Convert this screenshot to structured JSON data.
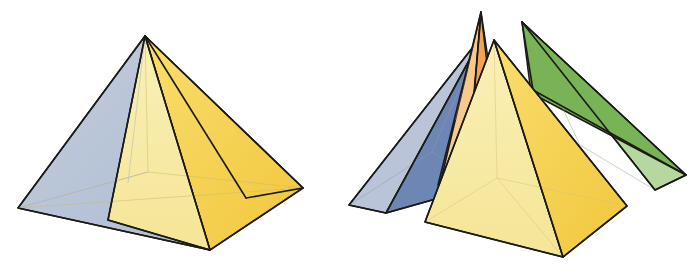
{
  "figure": {
    "caption_left": "Assembled square pyramid",
    "caption_right": "Exploded view showing the four component pieces",
    "background_color": "#ffffff",
    "outline_color": "#1a1a16",
    "hidden_edge_color": "#c9b96a"
  },
  "palette": {
    "blue_light": "#b9c4d8",
    "blue_mid": "#9aaac6",
    "blue_dark": "#6d86b4",
    "blue_darker": "#5b76a8",
    "yellow_pale": "#f8edab",
    "yellow_pale_2": "#f6e79a",
    "yellow_gold": "#f8d75a",
    "yellow_gold_2": "#f2c93f",
    "green_light": "#b7d7a0",
    "green_mid": "#8fc06b",
    "green_dark": "#6fae4f",
    "orange_light": "#f8c98c",
    "orange_mid": "#f4ac5c",
    "orange_dark": "#ef9a42"
  },
  "assembled_pyramid": {
    "name": "assembled-square-pyramid",
    "apex": {
      "x": 145,
      "y": 36
    },
    "base_vertices": {
      "left": {
        "x": 18,
        "y": 208
      },
      "front": {
        "x": 210,
        "y": 250
      },
      "right": {
        "x": 303,
        "y": 188
      },
      "back": {
        "x": 148,
        "y": 172
      }
    },
    "faces": [
      {
        "id": "left-blue-face",
        "label": "left blue face",
        "color": "#b9c4d8",
        "points": "145,36 18,208 210,250"
      },
      {
        "id": "front-pale-face",
        "label": "front pale yellow face",
        "color": "#f8edab",
        "points": "145,36 110,223 210,250"
      },
      {
        "id": "front-gold-face",
        "label": "front gold face",
        "color": "#f8d75a",
        "points": "145,36 210,250 303,188"
      },
      {
        "id": "right-green-face",
        "label": "right green face",
        "color": "#8fc06b",
        "points": "145,36 303,188 253,196"
      }
    ],
    "hidden_edges": [
      {
        "id": "hidden-apex-to-back",
        "from": {
          "x": 145,
          "y": 36
        },
        "to": {
          "x": 148,
          "y": 172
        }
      },
      {
        "id": "hidden-back-left",
        "from": {
          "x": 18,
          "y": 208
        },
        "to": {
          "x": 148,
          "y": 172
        }
      },
      {
        "id": "hidden-back-right",
        "from": {
          "x": 303,
          "y": 188
        },
        "to": {
          "x": 148,
          "y": 172
        }
      },
      {
        "id": "hidden-diagonal",
        "from": {
          "x": 18,
          "y": 208
        },
        "to": {
          "x": 303,
          "y": 188
        }
      },
      {
        "id": "hidden-front-back-diagonal",
        "from": {
          "x": 210,
          "y": 250
        },
        "to": {
          "x": 148,
          "y": 172
        }
      }
    ]
  },
  "exploded_pieces": [
    {
      "id": "blue-wedge",
      "name": "blue-wedge",
      "label": "blue triangular wedge",
      "apex": {
        "x": 484,
        "y": 33
      },
      "faces": [
        {
          "id": "blue-wedge-outer",
          "color": "#b9c4d8",
          "points": "484,33 349,205 386,213"
        },
        {
          "id": "blue-wedge-inner",
          "color": "#6d86b4",
          "points": "484,33 386,213 489,184"
        },
        {
          "id": "blue-wedge-base",
          "color": "#9aaac6",
          "points": "349,205 386,213 489,184"
        }
      ],
      "hidden_edges": [
        {
          "from": {
            "x": 484,
            "y": 33
          },
          "to": {
            "x": 430,
            "y": 155
          }
        },
        {
          "from": {
            "x": 349,
            "y": 205
          },
          "to": {
            "x": 430,
            "y": 155
          }
        },
        {
          "from": {
            "x": 489,
            "y": 184
          },
          "to": {
            "x": 430,
            "y": 155
          }
        }
      ]
    },
    {
      "id": "orange-wedge",
      "name": "orange-wedge",
      "label": "orange triangular wedge",
      "apex": {
        "x": 481,
        "y": 12
      },
      "faces": [
        {
          "id": "orange-wedge-outer",
          "color": "#f8c98c",
          "points": "481,12 441,180 467,183"
        },
        {
          "id": "orange-wedge-inner",
          "color": "#f4ac5c",
          "points": "481,12 467,183 497,150"
        },
        {
          "id": "orange-wedge-side",
          "color": "#ef9a42",
          "points": "481,12 497,150 503,70"
        }
      ],
      "hidden_edges": []
    },
    {
      "id": "green-wedge",
      "name": "green-wedge",
      "label": "green triangular wedge",
      "apex": {
        "x": 522,
        "y": 22
      },
      "faces": [
        {
          "id": "green-wedge-outer",
          "color": "#b7d7a0",
          "points": "522,22 655,190 686,175"
        },
        {
          "id": "green-wedge-inner",
          "color": "#6fae4f",
          "points": "522,22 686,175 531,93"
        },
        {
          "id": "green-wedge-base",
          "color": "#8fc06b",
          "points": "655,190 686,175 531,93"
        }
      ],
      "hidden_edges": [
        {
          "from": {
            "x": 522,
            "y": 22
          },
          "to": {
            "x": 575,
            "y": 140
          }
        },
        {
          "from": {
            "x": 655,
            "y": 190
          },
          "to": {
            "x": 575,
            "y": 140
          }
        }
      ]
    },
    {
      "id": "yellow-pyramid",
      "name": "yellow-pyramid",
      "label": "yellow square pyramid piece",
      "apex": {
        "x": 494,
        "y": 40
      },
      "base_vertices": {
        "left": {
          "x": 425,
          "y": 222
        },
        "front": {
          "x": 563,
          "y": 257
        },
        "right": {
          "x": 627,
          "y": 206
        },
        "back": {
          "x": 497,
          "y": 178
        }
      },
      "faces": [
        {
          "id": "yellow-left-face",
          "color": "#f8edab",
          "points": "494,40 425,222 563,257"
        },
        {
          "id": "yellow-right-face",
          "color": "#f8d75a",
          "points": "494,40 563,257 627,206"
        }
      ],
      "hidden_edges": [
        {
          "from": {
            "x": 494,
            "y": 40
          },
          "to": {
            "x": 497,
            "y": 178
          }
        },
        {
          "from": {
            "x": 425,
            "y": 222
          },
          "to": {
            "x": 497,
            "y": 178
          }
        },
        {
          "from": {
            "x": 627,
            "y": 206
          },
          "to": {
            "x": 497,
            "y": 178
          }
        },
        {
          "from": {
            "x": 563,
            "y": 257
          },
          "to": {
            "x": 497,
            "y": 178
          }
        }
      ]
    }
  ]
}
